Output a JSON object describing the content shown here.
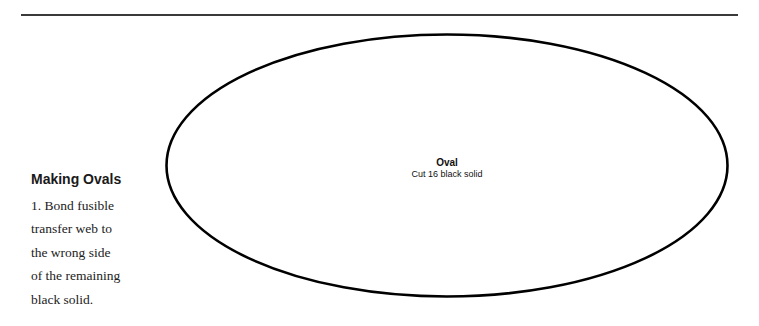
{
  "document": {
    "section_heading": "Making Ovals",
    "steps": [
      {
        "number": "1.",
        "lines": [
          "Bond fusible",
          "transfer web to",
          "the wrong side",
          "of the remaining",
          "black solid."
        ]
      }
    ]
  },
  "template_shape": {
    "shape": "oval",
    "label_title": "Oval",
    "label_instruction": "Cut 16 black solid",
    "stroke_color": "#000000"
  },
  "colors": {
    "rule": "#3a3a3a",
    "text": "#222222",
    "background": "#ffffff"
  }
}
